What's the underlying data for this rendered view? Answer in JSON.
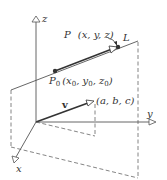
{
  "diagram": {
    "type": "3d-line-vector-figure",
    "axes": {
      "x": {
        "label": "x"
      },
      "y": {
        "label": "y"
      },
      "z": {
        "label": "z"
      }
    },
    "line": {
      "label": "L"
    },
    "point_p": {
      "label": "P",
      "coords": "(x, y, z)"
    },
    "point_p0": {
      "label": "P",
      "subscript": "0",
      "coords_parts": [
        "(x",
        "0",
        ", y",
        "0",
        ", z",
        "0",
        ")"
      ]
    },
    "vector": {
      "label": "v",
      "components": "(a, b, c)"
    },
    "colors": {
      "line": "#555555",
      "thick_line": "#333333",
      "dashed": "#666666",
      "text": "#333333"
    }
  }
}
